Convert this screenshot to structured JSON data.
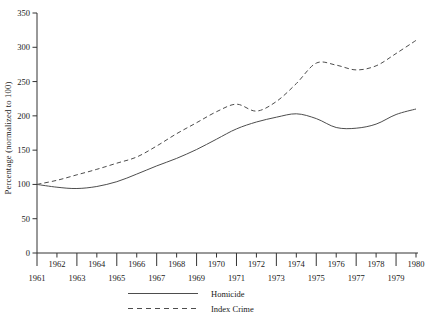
{
  "chart_data": {
    "type": "line",
    "title": "",
    "xlabel": "",
    "ylabel": "Percentage (normalized to 100)",
    "x": [
      1961,
      1962,
      1963,
      1964,
      1965,
      1966,
      1967,
      1968,
      1969,
      1970,
      1971,
      1972,
      1973,
      1974,
      1975,
      1976,
      1977,
      1978,
      1979,
      1980
    ],
    "x_range": [
      1961,
      1980
    ],
    "ylim": [
      0,
      350
    ],
    "yticks": [
      0,
      50,
      100,
      150,
      200,
      250,
      300,
      350
    ],
    "grid": false,
    "legend_position": "bottom-center",
    "series": [
      {
        "name": "Homicide",
        "style": "solid",
        "values": [
          100,
          96,
          94,
          97,
          104,
          115,
          127,
          138,
          151,
          166,
          181,
          191,
          198,
          203,
          196,
          183,
          182,
          188,
          202,
          210
        ]
      },
      {
        "name": "Index Crime",
        "style": "dashed",
        "values": [
          100,
          106,
          114,
          122,
          131,
          140,
          156,
          174,
          190,
          206,
          217,
          207,
          221,
          247,
          277,
          274,
          267,
          273,
          291,
          310
        ]
      }
    ],
    "colors": {
      "line": "#4d4d4d",
      "axis": "#333333",
      "text": "#1a1a1a",
      "background": "#ffffff"
    }
  },
  "legend": {
    "items": [
      {
        "label": "Homicide",
        "style": "solid"
      },
      {
        "label": "Index Crime",
        "style": "dashed"
      }
    ]
  }
}
